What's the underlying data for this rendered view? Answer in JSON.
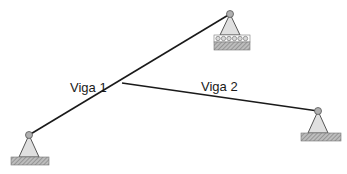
{
  "diagram": {
    "beams": [
      {
        "label": "Viga 1"
      },
      {
        "label": "Viga 2"
      }
    ],
    "supports": [
      {
        "type": "pinned",
        "position": "bottom-left"
      },
      {
        "type": "roller",
        "position": "top"
      },
      {
        "type": "pinned",
        "position": "right"
      }
    ],
    "colors": {
      "line": "#1a1a1a",
      "support_fill": "#e0e0e0",
      "pin_fill": "#b0b0b0",
      "hatch": "#8a8a8a"
    }
  }
}
